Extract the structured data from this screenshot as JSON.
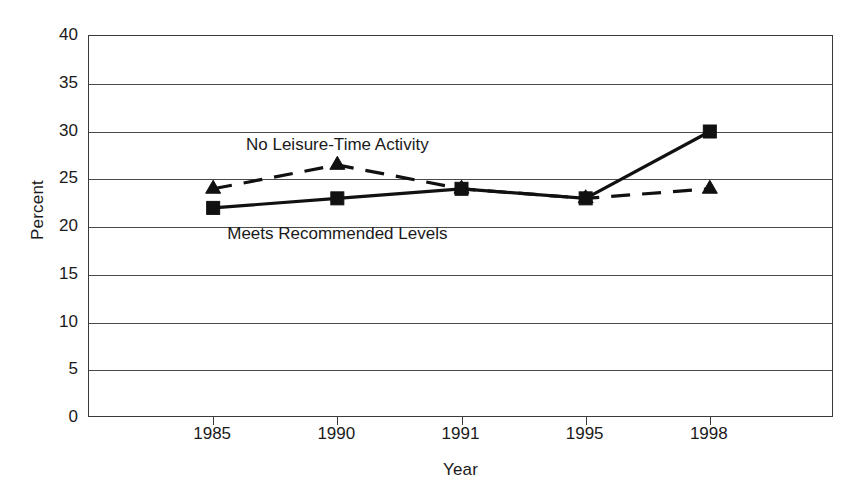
{
  "chart_data": {
    "type": "line",
    "title": "",
    "subtitle": "",
    "xlabel": "Year",
    "ylabel": "Percent",
    "categories": [
      "1985",
      "1990",
      "1991",
      "1995",
      "1998"
    ],
    "ylim": [
      0,
      40
    ],
    "yticks": [
      0,
      5,
      10,
      15,
      20,
      25,
      30,
      35,
      40
    ],
    "ytick_labels": [
      "0",
      "5",
      "10",
      "15",
      "20",
      "25",
      "30",
      "35",
      "40"
    ],
    "grid": "horizontal",
    "legend_position": "inline-annotation",
    "series": [
      {
        "name": "No Leisure-Time Activity",
        "values": [
          24,
          26.5,
          24,
          23,
          24
        ],
        "line_style": "dashed",
        "marker": "triangle",
        "color": "#111111"
      },
      {
        "name": "Meets Recommended Levels",
        "values": [
          22,
          23,
          24,
          23,
          30
        ],
        "line_style": "solid",
        "marker": "square",
        "color": "#111111"
      }
    ],
    "annotations": [
      {
        "text": "No Leisure-Time Activity",
        "x_category": "1990",
        "y_value": 28.6
      },
      {
        "text": "Meets Recommended Levels",
        "x_category": "1990",
        "y_value": 19.3
      }
    ]
  },
  "colors": {
    "background": "#ffffff",
    "axis": "#3a3a3a",
    "gridline": "#4a4a4a",
    "text": "#1a1a1a",
    "series": "#111111"
  }
}
